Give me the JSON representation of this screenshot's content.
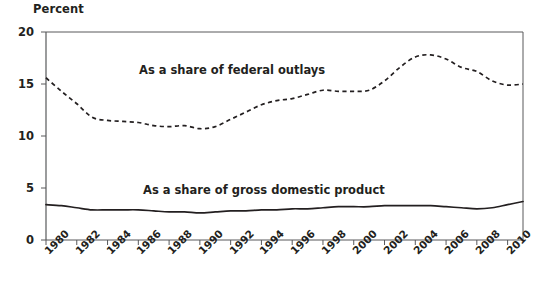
{
  "chart_data": {
    "type": "line",
    "title": "",
    "subtitle": "",
    "xlabel": "",
    "ylabel": "Percent",
    "ylim": [
      0,
      20
    ],
    "yticks": [
      0,
      5,
      10,
      15,
      20
    ],
    "xlim": [
      1980,
      2011
    ],
    "xticks": [
      1980,
      1982,
      1984,
      1986,
      1988,
      1990,
      1992,
      1994,
      1996,
      1998,
      2000,
      2002,
      2004,
      2006,
      2008,
      2010
    ],
    "xticklabels": [
      "1980",
      "1982",
      "1984",
      "1986",
      "1988",
      "1990",
      "1992",
      "1994",
      "1996",
      "1998",
      "2000",
      "2002",
      "2004",
      "2006",
      "2008",
      "2010"
    ],
    "grid": false,
    "legend_position": "inline-annotation",
    "x": [
      1980,
      1981,
      1982,
      1983,
      1984,
      1985,
      1986,
      1987,
      1988,
      1989,
      1990,
      1991,
      1992,
      1993,
      1994,
      1995,
      1996,
      1997,
      1998,
      1999,
      2000,
      2001,
      2002,
      2003,
      2004,
      2005,
      2006,
      2007,
      2008,
      2009,
      2010,
      2011
    ],
    "series": [
      {
        "name": "As a share of federal outlays",
        "style": "dashed",
        "color": "#231f20",
        "values": [
          15.6,
          14.3,
          13.1,
          11.8,
          11.5,
          11.4,
          11.3,
          11.0,
          10.9,
          11.0,
          10.7,
          10.9,
          11.6,
          12.3,
          13.0,
          13.4,
          13.6,
          14.0,
          14.4,
          14.3,
          14.3,
          14.4,
          15.3,
          16.6,
          17.6,
          17.8,
          17.4,
          16.6,
          16.2,
          15.3,
          14.9,
          15.0
        ]
      },
      {
        "name": "As a share of gross domestic product",
        "style": "solid",
        "color": "#231f20",
        "values": [
          3.4,
          3.3,
          3.1,
          2.9,
          2.9,
          2.9,
          2.9,
          2.8,
          2.7,
          2.7,
          2.6,
          2.7,
          2.8,
          2.8,
          2.9,
          2.9,
          3.0,
          3.0,
          3.1,
          3.2,
          3.2,
          3.2,
          3.3,
          3.3,
          3.3,
          3.3,
          3.2,
          3.1,
          3.0,
          3.1,
          3.4,
          3.7
        ]
      }
    ],
    "annotations": [
      {
        "text": "As a share of federal outlays",
        "x": 1987.2,
        "y": 16.6
      },
      {
        "text": "As a share of gross domestic product",
        "x": 1987.5,
        "y": 5.1
      }
    ]
  },
  "axis": {
    "y_title": "Percent",
    "y_tick_labels": [
      "20",
      "15",
      "10",
      "5",
      "0"
    ],
    "x_tick_labels": [
      "1980",
      "1982",
      "1984",
      "1986",
      "1988",
      "1990",
      "1992",
      "1994",
      "1996",
      "1998",
      "2000",
      "2002",
      "2004",
      "2006",
      "2008",
      "2010"
    ]
  },
  "colors": {
    "ink": "#231f20",
    "axis": "#58595b",
    "background": "#ffffff"
  }
}
